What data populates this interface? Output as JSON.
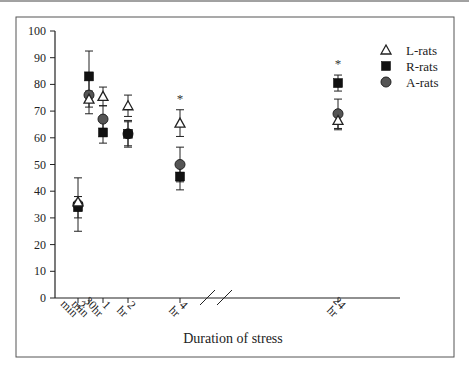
{
  "chart_data": {
    "type": "scatter",
    "title": "",
    "xlabel": "Duration of stress",
    "ylabel": "",
    "ylim": [
      0,
      100
    ],
    "yticks": [
      0,
      10,
      20,
      30,
      40,
      50,
      60,
      70,
      80,
      90,
      100
    ],
    "categories": [
      "2 min",
      "30 min",
      "1 hr",
      "2 hr",
      "4 hr",
      "24 hr"
    ],
    "axis_break": "between 4 hr and 24 hr",
    "grid": false,
    "legend_position": "top-right",
    "significance_marker": "*",
    "significant_categories": [
      "4 hr",
      "24 hr"
    ],
    "series": [
      {
        "name": "L-rats",
        "marker": "open-triangle",
        "color": "#ffffff",
        "values": [
          36,
          74.5,
          75.5,
          72,
          65.5,
          66.5
        ],
        "error": [
          2,
          3,
          3.5,
          4,
          5,
          3.5
        ]
      },
      {
        "name": "R-rats",
        "marker": "filled-square",
        "color": "#111111",
        "values": [
          34,
          83,
          62,
          61.5,
          45.5,
          80.5
        ],
        "error": [
          4,
          9.5,
          4,
          4.5,
          5,
          3
        ]
      },
      {
        "name": "A-rats",
        "marker": "filled-circle",
        "color": "#555555",
        "values": [
          35,
          76,
          67,
          61.5,
          50,
          69
        ],
        "error": [
          10,
          7,
          5,
          5,
          6.5,
          5.5
        ]
      }
    ]
  }
}
